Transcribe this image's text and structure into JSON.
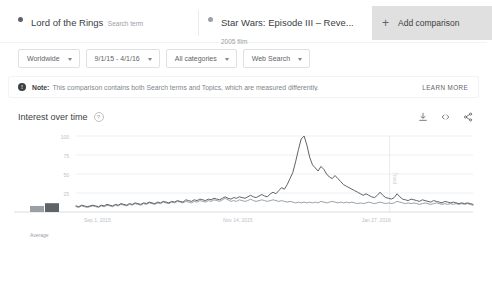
{
  "comparison": {
    "terms": [
      {
        "title": "Lord of the Rings",
        "subtitle": "Search term",
        "color": "#5f6368"
      },
      {
        "title": "Star Wars: Episode III – Reve...",
        "subtitle": "2005 film",
        "color": "#9aa0a6"
      }
    ],
    "add_label": "Add comparison",
    "add_icon": "plus-icon"
  },
  "filters": [
    {
      "label": "Worldwide",
      "name": "location"
    },
    {
      "label": "9/1/15 - 4/1/16",
      "name": "date-range"
    },
    {
      "label": "All categories",
      "name": "category"
    },
    {
      "label": "Web Search",
      "name": "search-type"
    }
  ],
  "caret_glyph": "▾",
  "note": {
    "icon": "info-icon",
    "badge_glyph": "!",
    "strong": "Note:",
    "text": "This comparison contains both Search terms and Topics, which are measured differently.",
    "learn_more": "LEARN MORE"
  },
  "section": {
    "title": "Interest over time",
    "help_icon": "help-icon",
    "help_glyph": "?",
    "actions": [
      {
        "name": "download-icon",
        "label": "Download"
      },
      {
        "name": "embed-icon",
        "label": "Embed"
      },
      {
        "name": "share-icon",
        "label": "Share"
      }
    ]
  },
  "chart_data": {
    "type": "line",
    "title": "Interest over time",
    "xlabel": "",
    "ylabel": "",
    "ylim": [
      0,
      100
    ],
    "yticks": [
      25,
      50,
      75,
      100
    ],
    "grid": true,
    "legend": "none",
    "average_label": "Average",
    "xticks": [
      "Sep 1, 2015",
      "Nov 14, 2015",
      "Jan 27, 2016"
    ],
    "xtick_positions": [
      0.02,
      0.37,
      0.72
    ],
    "annotation": {
      "label": "Trend",
      "position": 0.79
    },
    "series": [
      {
        "name": "Star Wars: Episode III – Reve...",
        "color": "#5f6368",
        "values": [
          8,
          7,
          9,
          8,
          7,
          8,
          9,
          8,
          7,
          9,
          8,
          10,
          9,
          8,
          10,
          9,
          11,
          10,
          9,
          11,
          10,
          12,
          11,
          10,
          12,
          11,
          13,
          12,
          11,
          13,
          12,
          14,
          13,
          12,
          14,
          13,
          15,
          14,
          13,
          16,
          15,
          14,
          16,
          15,
          17,
          16,
          15,
          17,
          16,
          18,
          17,
          16,
          18,
          20,
          18,
          17,
          19,
          18,
          20,
          19,
          18,
          20,
          22,
          20,
          19,
          21,
          23,
          21,
          20,
          24,
          26,
          24,
          28,
          32,
          30,
          36,
          44,
          52,
          66,
          82,
          96,
          100,
          88,
          72,
          62,
          58,
          54,
          60,
          56,
          50,
          46,
          44,
          48,
          44,
          40,
          36,
          34,
          32,
          30,
          28,
          26,
          24,
          22,
          24,
          22,
          20,
          19,
          22,
          26,
          22,
          19,
          18,
          17,
          19,
          24,
          20,
          17,
          16,
          15,
          17,
          16,
          15,
          14,
          16,
          15,
          14,
          13,
          15,
          14,
          13,
          12,
          14,
          13,
          12,
          13,
          12,
          11,
          12,
          11,
          12,
          11,
          10
        ]
      },
      {
        "name": "Lord of the Rings",
        "color": "#9aa0a6",
        "values": [
          7,
          6,
          8,
          7,
          6,
          7,
          8,
          7,
          6,
          8,
          7,
          9,
          8,
          7,
          9,
          8,
          10,
          9,
          8,
          10,
          9,
          11,
          10,
          9,
          11,
          10,
          12,
          11,
          10,
          12,
          11,
          13,
          12,
          11,
          13,
          12,
          14,
          13,
          12,
          14,
          13,
          12,
          14,
          13,
          15,
          14,
          13,
          15,
          14,
          16,
          15,
          14,
          16,
          18,
          16,
          14,
          15,
          14,
          16,
          15,
          14,
          15,
          17,
          15,
          14,
          15,
          16,
          15,
          14,
          15,
          16,
          15,
          14,
          15,
          14,
          13,
          14,
          13,
          12,
          13,
          12,
          13,
          12,
          13,
          12,
          13,
          12,
          14,
          13,
          12,
          13,
          14,
          13,
          12,
          13,
          12,
          13,
          12,
          13,
          12,
          11,
          12,
          11,
          12,
          13,
          12,
          11,
          12,
          13,
          12,
          11,
          12,
          11,
          12,
          14,
          13,
          12,
          11,
          12,
          11,
          12,
          11,
          10,
          11,
          12,
          11,
          10,
          11,
          12,
          11,
          10,
          11,
          10,
          11,
          10,
          11,
          10,
          11,
          10,
          11,
          10,
          9
        ]
      }
    ],
    "average_bars": [
      {
        "value": 0.55
      },
      {
        "value": 0.8
      }
    ]
  }
}
